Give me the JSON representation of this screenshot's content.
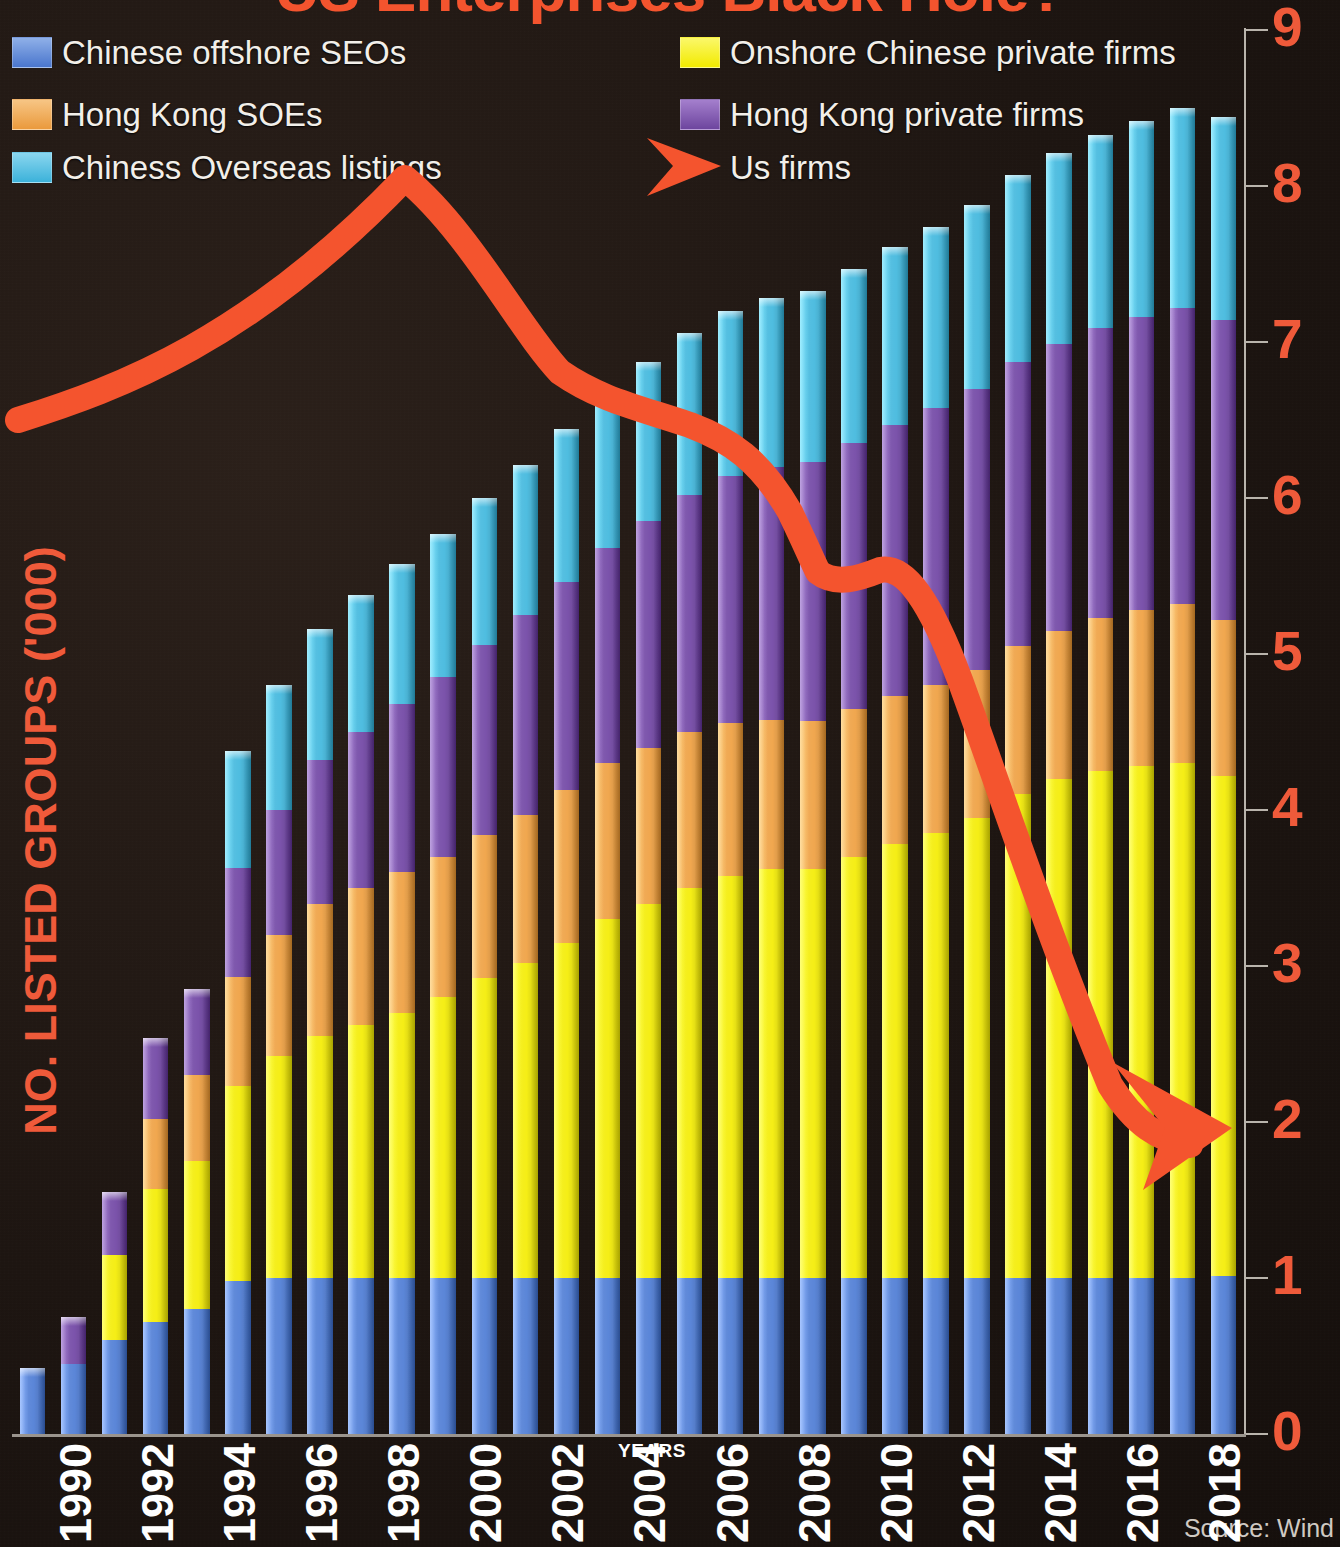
{
  "title": "US Enterprises Black Hole?",
  "source_note": "Source: Wind",
  "axes": {
    "y_title": "NO. LISTED GROUPS ('000)",
    "x_title": "YEARS",
    "y_ticks": [
      "0",
      "1",
      "2",
      "3",
      "4",
      "5",
      "6",
      "7",
      "8",
      "9"
    ],
    "x_ticks": [
      "1990",
      "1992",
      "1994",
      "1996",
      "1998",
      "2000",
      "2002",
      "2004",
      "2006",
      "2008",
      "2010",
      "2012",
      "2014",
      "2016",
      "2018"
    ]
  },
  "legend": [
    {
      "label": "Chinese offshore SEOs",
      "color": "#5b86d8"
    },
    {
      "label": "Hong Kong SOEs",
      "color": "#f0a74f"
    },
    {
      "label": "Chiness Overseas listings",
      "color": "#4fbde0"
    },
    {
      "label": "Onshore Chinese private firms",
      "color": "#f5ee16"
    },
    {
      "label": "Hong Kong private firms",
      "color": "#7b53ab"
    },
    {
      "label": "Us firms",
      "color": "#f4542e"
    }
  ],
  "colors": {
    "background": "#1d1511",
    "accent_red": "#f4542e",
    "axis_line": "#b9b4ac",
    "tick_label": "#ef5a3a",
    "year_label": "#ffffff"
  },
  "chart_data": {
    "type": "bar",
    "title": "US Enterprises Black Hole?",
    "xlabel": "YEARS",
    "ylabel": "NO. LISTED GROUPS ('000)",
    "ylim": [
      0,
      9
    ],
    "grid": false,
    "legend_position": "top",
    "stacked": true,
    "categories": [
      "1990",
      "1991",
      "1992",
      "1993",
      "1994",
      "1995",
      "1996",
      "1997",
      "1998",
      "1999",
      "2000",
      "2001",
      "2002",
      "2003",
      "2004",
      "2005",
      "2006",
      "2007",
      "2008",
      "2009",
      "2010",
      "2011",
      "2012",
      "2013",
      "2014",
      "2015",
      "2016",
      "2017",
      "2018",
      "2019"
    ],
    "series": [
      {
        "name": "Chinese offshore SEOs",
        "color": "#5b86d8",
        "values": [
          0.42,
          0.45,
          0.6,
          0.72,
          0.8,
          0.98,
          1.0,
          1.0,
          1.0,
          1.0,
          1.0,
          1.0,
          1.0,
          1.0,
          1.0,
          1.0,
          1.0,
          1.0,
          1.0,
          1.0,
          1.0,
          1.0,
          1.0,
          1.0,
          1.0,
          1.0,
          1.0,
          1.0,
          1.0,
          1.01
        ]
      },
      {
        "name": "Onshore Chinese private firms",
        "color": "#f5ee16",
        "values": [
          0.0,
          0.0,
          0.55,
          0.85,
          0.95,
          1.25,
          1.42,
          1.55,
          1.62,
          1.7,
          1.8,
          1.92,
          2.02,
          2.15,
          2.3,
          2.4,
          2.5,
          2.58,
          2.62,
          2.62,
          2.7,
          2.78,
          2.85,
          2.95,
          3.1,
          3.2,
          3.25,
          3.28,
          3.3,
          3.21
        ]
      },
      {
        "name": "Hong Kong SOEs",
        "color": "#f0a74f",
        "values": [
          0.0,
          0.0,
          0.0,
          0.45,
          0.55,
          0.7,
          0.78,
          0.85,
          0.88,
          0.9,
          0.9,
          0.92,
          0.95,
          0.98,
          1.0,
          1.0,
          1.0,
          0.98,
          0.96,
          0.95,
          0.95,
          0.95,
          0.95,
          0.95,
          0.95,
          0.95,
          0.98,
          1.0,
          1.02,
          1.0
        ]
      },
      {
        "name": "Hong Kong private firms",
        "color": "#7b53ab",
        "values": [
          0.0,
          0.3,
          0.4,
          0.52,
          0.55,
          0.7,
          0.8,
          0.92,
          1.0,
          1.08,
          1.15,
          1.22,
          1.28,
          1.33,
          1.38,
          1.45,
          1.52,
          1.58,
          1.62,
          1.66,
          1.7,
          1.74,
          1.78,
          1.8,
          1.82,
          1.84,
          1.86,
          1.88,
          1.9,
          1.92
        ]
      },
      {
        "name": "Chiness Overseas listings",
        "color": "#4fbde0",
        "values": [
          0.0,
          0.0,
          0.0,
          0.0,
          0.0,
          0.75,
          0.8,
          0.84,
          0.88,
          0.9,
          0.92,
          0.94,
          0.96,
          0.98,
          1.0,
          1.02,
          1.04,
          1.06,
          1.08,
          1.1,
          1.12,
          1.14,
          1.16,
          1.18,
          1.2,
          1.22,
          1.24,
          1.26,
          1.28,
          1.3
        ]
      }
    ],
    "overlay_line": {
      "name": "Us firms",
      "color": "#f4542e",
      "x": [
        "1990",
        "1993",
        "1998",
        "1999",
        "2001",
        "2003",
        "2005",
        "2006",
        "2008",
        "2010",
        "2011",
        "2013",
        "2015",
        "2017"
      ],
      "y": [
        6.55,
        7.05,
        7.85,
        8.05,
        7.35,
        6.95,
        6.8,
        6.4,
        6.25,
        5.55,
        5.52,
        4.3,
        3.0,
        2.05
      ],
      "ends_with_arrow": true
    }
  }
}
